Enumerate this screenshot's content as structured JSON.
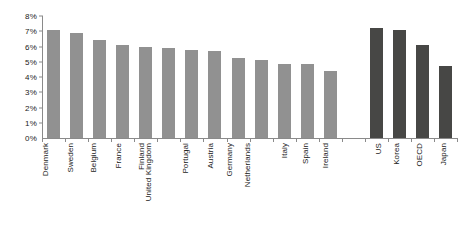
{
  "chart_data": {
    "type": "bar",
    "title": "",
    "subtitle": "",
    "xlabel": "",
    "ylabel": "",
    "ylim": [
      0,
      8
    ],
    "ytick_labels": [
      "8%",
      "7%",
      "6%",
      "5%",
      "4%",
      "3%",
      "2%",
      "1%",
      "0%"
    ],
    "ytick_values": [
      8,
      7,
      6,
      5,
      4,
      3,
      2,
      1,
      0
    ],
    "ytick_format": "percent",
    "grid": false,
    "legend": "none",
    "orientation": "vertical",
    "categories": [
      "Denmark",
      "Sweden",
      "Belgium",
      "France",
      "Finland",
      "United Kingdom",
      "Portugal",
      "Austria",
      "Germany",
      "Netherlands",
      "Italy",
      "Spain",
      "Ireland",
      "",
      "US",
      "Korea",
      "OECD",
      "Japan"
    ],
    "values": [
      7.1,
      6.9,
      6.4,
      6.1,
      6.0,
      5.9,
      5.8,
      5.7,
      5.25,
      5.1,
      4.85,
      4.85,
      4.4,
      null,
      7.2,
      7.1,
      6.1,
      4.7
    ],
    "bar_colors": [
      "light",
      "light",
      "light",
      "light",
      "light",
      "light",
      "light",
      "light",
      "light",
      "light",
      "light",
      "light",
      "light",
      "gap",
      "dark",
      "dark",
      "dark",
      "dark"
    ],
    "colors": {
      "light_bar": "#919191",
      "dark_bar": "#474745",
      "axis": "#8a8a8a",
      "text": "#1a1a1a",
      "background": "#ffffff"
    }
  }
}
